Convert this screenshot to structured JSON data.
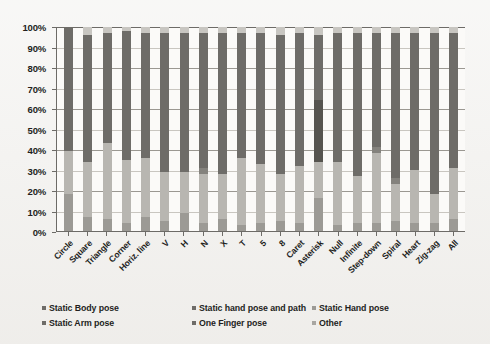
{
  "chart_data": {
    "type": "bar",
    "subtype": "100% stacked bar",
    "title": "",
    "xlabel": "",
    "ylabel": "",
    "ylim": [
      0,
      100
    ],
    "ytick_labels": [
      "100%",
      "90%",
      "80%",
      "70%",
      "60%",
      "50%",
      "40%",
      "30%",
      "20%",
      "10%",
      "0%"
    ],
    "ytick_values": [
      100,
      90,
      80,
      70,
      60,
      50,
      40,
      30,
      20,
      10,
      0
    ],
    "grid": true,
    "legend_position": "bottom",
    "categories": [
      "Circle",
      "Square",
      "Triangle",
      "Corner",
      "Horiz. line",
      "V",
      "H",
      "N",
      "X",
      "T",
      "5",
      "8",
      "Caret",
      "Asterisk",
      "Null",
      "Infinite",
      "Step-down",
      "Spiral",
      "Heart",
      "Zig-zag",
      "All"
    ],
    "series": [
      {
        "name": "Static Body pose",
        "color": "#9c9a95",
        "values": [
          18,
          7,
          6,
          4,
          7,
          5,
          9,
          4,
          6,
          3,
          4,
          5,
          4,
          16,
          3,
          4,
          4,
          5,
          4,
          4,
          6
        ]
      },
      {
        "name": "Static Arm pose",
        "color": "#b8b6b1",
        "values": [
          21,
          27,
          37,
          31,
          29,
          24,
          20,
          24,
          22,
          33,
          29,
          23,
          28,
          18,
          31,
          23,
          34,
          18,
          26,
          14,
          25
        ]
      },
      {
        "name": "Static Hand pose",
        "color": "#6e6c68",
        "values": [
          61,
          62,
          54,
          63,
          61,
          68,
          68,
          66,
          69,
          61,
          64,
          68,
          65,
          32,
          63,
          70,
          56,
          71,
          67,
          79,
          66
        ]
      },
      {
        "name": "Static hand pose and path",
        "color": "#56544f",
        "values": [
          0,
          0,
          0,
          0,
          0,
          0,
          0,
          0,
          0,
          0,
          0,
          0,
          0,
          30,
          0,
          0,
          0,
          0,
          0,
          0,
          0
        ]
      },
      {
        "name": "One Finger pose",
        "color": "#84827d",
        "values": [
          0,
          0,
          0,
          0,
          0,
          0,
          0,
          3,
          0,
          0,
          0,
          0,
          0,
          0,
          0,
          0,
          3,
          3,
          0,
          0,
          0
        ]
      },
      {
        "name": "Other",
        "color": "#c8c6c1",
        "values": [
          0,
          4,
          3,
          2,
          3,
          3,
          3,
          3,
          3,
          3,
          3,
          4,
          3,
          4,
          3,
          3,
          3,
          3,
          3,
          3,
          3
        ]
      }
    ]
  },
  "legend": {
    "items": [
      {
        "label": "Static Body pose",
        "color": "#6e6c68"
      },
      {
        "label": "Static Arm pose",
        "color": "#6e6c68"
      },
      {
        "label": "Static Hand pose",
        "color": "#9c9a95"
      },
      {
        "label": "Static hand pose and path",
        "color": "#6e6c68"
      },
      {
        "label": "One Finger pose",
        "color": "#6e6c68"
      },
      {
        "label": "Other",
        "color": "#a8a6a1"
      }
    ]
  }
}
